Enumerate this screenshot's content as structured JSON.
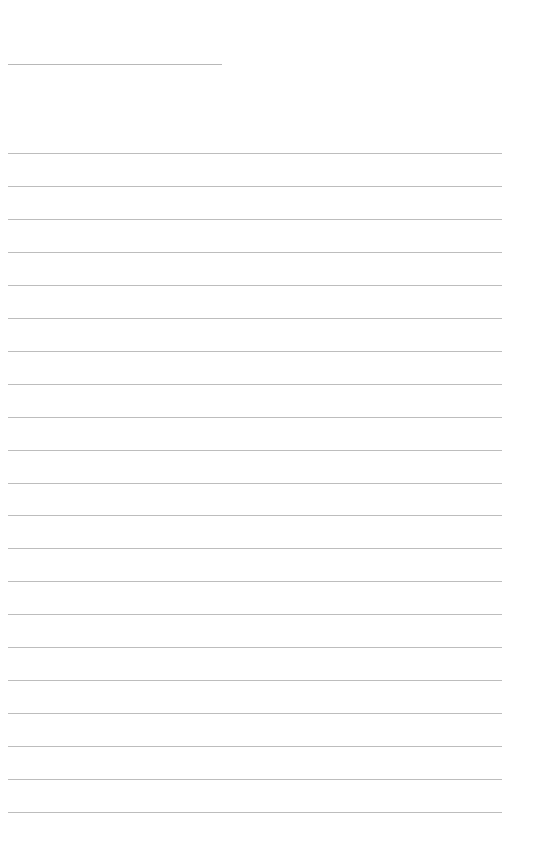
{
  "page": {
    "type": "lined-paper",
    "background": "#ffffff",
    "line_color": "#bdbdbd",
    "title_line": {
      "left": 8,
      "top": 64,
      "width": 214,
      "text": ""
    },
    "ruled_lines": {
      "count": 21,
      "first_top": 153,
      "spacing": 32.95,
      "left": 8,
      "width": 494
    },
    "lines_text": [
      "",
      "",
      "",
      "",
      "",
      "",
      "",
      "",
      "",
      "",
      "",
      "",
      "",
      "",
      "",
      "",
      "",
      "",
      "",
      "",
      ""
    ]
  }
}
